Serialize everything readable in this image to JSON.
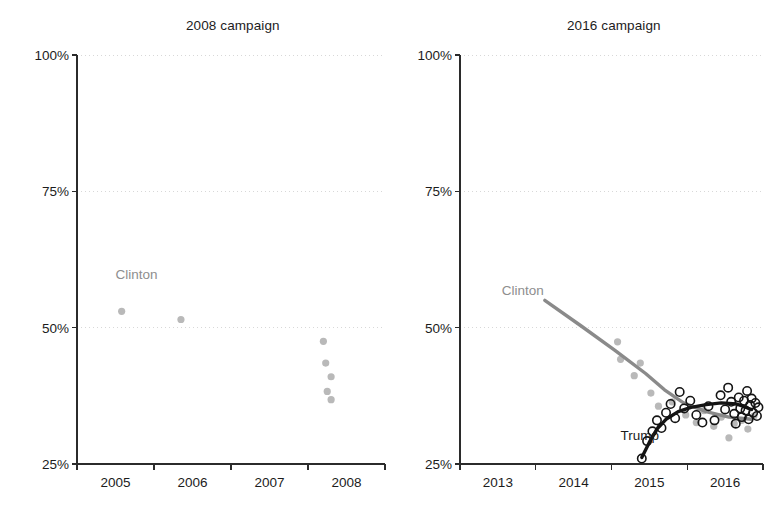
{
  "figure": {
    "width": 773,
    "height": 517,
    "background": "#ffffff"
  },
  "colors": {
    "clinton": "#b9b9b9",
    "clinton_line": "#8a8a8a",
    "clinton_label": "#8e8e8e",
    "trump": "#141414",
    "trump_line": "#141414",
    "axis": "#2b2b2b",
    "grid": "#d8d8d8",
    "text": "#1c1c1c"
  },
  "chart_data": [
    {
      "id": "panel-2008",
      "type": "scatter",
      "title": "2008 campaign",
      "xlabel": "",
      "ylabel": "",
      "xlim": [
        2004.5,
        2008.5
      ],
      "ylim": [
        25,
        100
      ],
      "grid": true,
      "legend": "inline-labels",
      "yticks": [
        25,
        50,
        75,
        100
      ],
      "ytick_labels": [
        "25%",
        "50%",
        "75%",
        "100%"
      ],
      "xticks": [
        2004.5,
        2005.5,
        2006.5,
        2007.5,
        2008.5
      ],
      "xtick_labels": [
        "2005",
        "2006",
        "2007",
        "2008"
      ],
      "xtick_label_positions": [
        2005,
        2006,
        2007,
        2008
      ],
      "annotations": [
        {
          "text": "Clinton",
          "x": 2005.0,
          "y": 59.5,
          "series": "Clinton"
        }
      ],
      "series": [
        {
          "name": "Clinton",
          "style": "filled-circle",
          "color": "#b9b9b9",
          "points": [
            {
              "x": 2005.08,
              "y": 53.0
            },
            {
              "x": 2005.85,
              "y": 51.5
            },
            {
              "x": 2007.7,
              "y": 47.5
            },
            {
              "x": 2007.73,
              "y": 43.5
            },
            {
              "x": 2007.8,
              "y": 41.0
            },
            {
              "x": 2007.75,
              "y": 38.3
            },
            {
              "x": 2007.8,
              "y": 36.8
            }
          ]
        }
      ]
    },
    {
      "id": "panel-2016",
      "type": "scatter",
      "title": "2016 campaign",
      "xlabel": "",
      "ylabel": "",
      "xlim": [
        2012.5,
        2016.5
      ],
      "ylim": [
        25,
        100
      ],
      "grid": true,
      "legend": "inline-labels",
      "yticks": [
        25,
        50,
        75,
        100
      ],
      "ytick_labels": [
        "25%",
        "50%",
        "75%",
        "100%"
      ],
      "xticks": [
        2012.5,
        2013.5,
        2014.5,
        2015.5,
        2016.5
      ],
      "xtick_labels": [
        "2013",
        "2014",
        "2015",
        "2016"
      ],
      "xtick_label_positions": [
        2013,
        2014,
        2015,
        2016
      ],
      "annotations": [
        {
          "text": "Clinton",
          "x": 2013.05,
          "y": 56.5,
          "series": "Clinton"
        },
        {
          "text": "Trump",
          "x": 2014.62,
          "y": 30.0,
          "series": "Trump"
        }
      ],
      "series": [
        {
          "name": "Clinton",
          "style": "filled-circle-with-trendline",
          "color": "#b9b9b9",
          "line_color": "#8a8a8a",
          "trendline": [
            {
              "x": 2013.62,
              "y": 55.0
            },
            {
              "x": 2014.1,
              "y": 50.3
            },
            {
              "x": 2014.55,
              "y": 45.8
            },
            {
              "x": 2014.95,
              "y": 41.6
            },
            {
              "x": 2015.2,
              "y": 38.6
            },
            {
              "x": 2015.45,
              "y": 36.2
            },
            {
              "x": 2015.75,
              "y": 34.6
            },
            {
              "x": 2016.05,
              "y": 33.6
            },
            {
              "x": 2016.35,
              "y": 33.2
            }
          ],
          "points": [
            {
              "x": 2014.58,
              "y": 47.4
            },
            {
              "x": 2014.62,
              "y": 44.2
            },
            {
              "x": 2014.8,
              "y": 41.2
            },
            {
              "x": 2014.88,
              "y": 43.5
            },
            {
              "x": 2015.02,
              "y": 38.0
            },
            {
              "x": 2015.12,
              "y": 35.6
            },
            {
              "x": 2015.3,
              "y": 36.4
            },
            {
              "x": 2015.48,
              "y": 34.0
            },
            {
              "x": 2015.62,
              "y": 32.6
            },
            {
              "x": 2015.72,
              "y": 34.8
            },
            {
              "x": 2015.85,
              "y": 31.9
            },
            {
              "x": 2015.95,
              "y": 33.6
            },
            {
              "x": 2016.05,
              "y": 29.8
            },
            {
              "x": 2016.12,
              "y": 32.4
            },
            {
              "x": 2016.22,
              "y": 33.0
            },
            {
              "x": 2016.3,
              "y": 31.4
            },
            {
              "x": 2016.38,
              "y": 33.8
            }
          ]
        },
        {
          "name": "Trump",
          "style": "open-circle-with-trendline",
          "color": "#141414",
          "line_color": "#141414",
          "trendline": [
            {
              "x": 2014.9,
              "y": 26.2
            },
            {
              "x": 2015.0,
              "y": 29.0
            },
            {
              "x": 2015.1,
              "y": 31.4
            },
            {
              "x": 2015.22,
              "y": 33.2
            },
            {
              "x": 2015.38,
              "y": 34.6
            },
            {
              "x": 2015.55,
              "y": 35.4
            },
            {
              "x": 2015.75,
              "y": 35.9
            },
            {
              "x": 2015.95,
              "y": 36.2
            },
            {
              "x": 2016.15,
              "y": 36.0
            },
            {
              "x": 2016.35,
              "y": 35.0
            }
          ],
          "points": [
            {
              "x": 2014.9,
              "y": 26.0
            },
            {
              "x": 2014.97,
              "y": 29.2
            },
            {
              "x": 2015.04,
              "y": 31.0
            },
            {
              "x": 2015.1,
              "y": 33.0
            },
            {
              "x": 2015.16,
              "y": 31.6
            },
            {
              "x": 2015.22,
              "y": 34.4
            },
            {
              "x": 2015.28,
              "y": 36.0
            },
            {
              "x": 2015.34,
              "y": 33.4
            },
            {
              "x": 2015.4,
              "y": 38.2
            },
            {
              "x": 2015.46,
              "y": 35.2
            },
            {
              "x": 2015.54,
              "y": 36.6
            },
            {
              "x": 2015.62,
              "y": 34.0
            },
            {
              "x": 2015.7,
              "y": 32.6
            },
            {
              "x": 2015.78,
              "y": 35.6
            },
            {
              "x": 2015.86,
              "y": 33.0
            },
            {
              "x": 2015.94,
              "y": 37.6
            },
            {
              "x": 2016.0,
              "y": 35.0
            },
            {
              "x": 2016.04,
              "y": 39.0
            },
            {
              "x": 2016.08,
              "y": 36.4
            },
            {
              "x": 2016.12,
              "y": 34.2
            },
            {
              "x": 2016.14,
              "y": 32.4
            },
            {
              "x": 2016.18,
              "y": 37.2
            },
            {
              "x": 2016.2,
              "y": 35.2
            },
            {
              "x": 2016.22,
              "y": 33.6
            },
            {
              "x": 2016.25,
              "y": 36.6
            },
            {
              "x": 2016.27,
              "y": 34.8
            },
            {
              "x": 2016.29,
              "y": 38.4
            },
            {
              "x": 2016.31,
              "y": 33.2
            },
            {
              "x": 2016.33,
              "y": 35.8
            },
            {
              "x": 2016.35,
              "y": 37.0
            },
            {
              "x": 2016.37,
              "y": 34.4
            },
            {
              "x": 2016.4,
              "y": 36.2
            },
            {
              "x": 2016.42,
              "y": 33.8
            },
            {
              "x": 2016.44,
              "y": 35.4
            }
          ]
        }
      ]
    }
  ]
}
